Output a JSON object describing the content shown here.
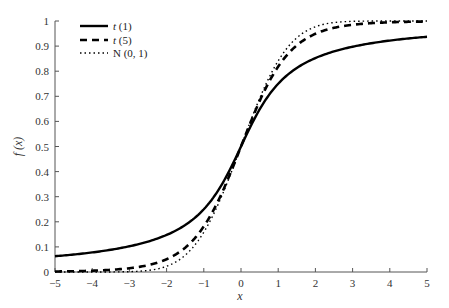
{
  "chart_data": {
    "type": "line",
    "title": "",
    "xlabel": "x",
    "ylabel": "f (x)",
    "xlim": [
      -5,
      5
    ],
    "ylim": [
      0,
      1
    ],
    "grid": false,
    "legend_position": "upper left",
    "x_ticks": [
      "−5",
      "−4",
      "−3",
      "−2",
      "−1",
      "0",
      "1",
      "2",
      "3",
      "4",
      "5"
    ],
    "y_ticks": [
      "0",
      "0.1",
      "0.2",
      "0.3",
      "0.4",
      "0.5",
      "0.6",
      "0.7",
      "0.8",
      "0.9",
      "1"
    ],
    "x": [
      -5,
      -4,
      -3,
      -2,
      -1,
      0,
      1,
      2,
      3,
      4,
      5
    ],
    "series": [
      {
        "name": "t (1)",
        "style": "solid",
        "values": [
          0.063,
          0.078,
          0.102,
          0.148,
          0.25,
          0.5,
          0.75,
          0.852,
          0.898,
          0.922,
          0.937
        ]
      },
      {
        "name": "t (5)",
        "style": "dashed",
        "values": [
          0.002,
          0.005,
          0.015,
          0.051,
          0.182,
          0.5,
          0.818,
          0.949,
          0.985,
          0.995,
          0.998
        ]
      },
      {
        "name": "N (0, 1)",
        "style": "dotted",
        "values": [
          0.0,
          0.0,
          0.001,
          0.023,
          0.159,
          0.5,
          0.841,
          0.977,
          0.999,
          1.0,
          1.0
        ]
      }
    ]
  }
}
